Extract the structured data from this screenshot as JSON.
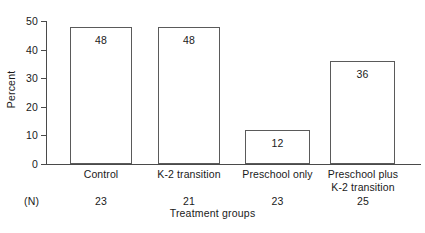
{
  "chart_data": {
    "type": "bar",
    "title": "",
    "xlabel": "Treatment groups",
    "ylabel": "Percent",
    "categories": [
      "Control",
      "K-2 transition",
      "Preschool only",
      "Preschool plus K-2 transition"
    ],
    "category_lines": [
      [
        "Control"
      ],
      [
        "K-2 transition"
      ],
      [
        "Preschool only"
      ],
      [
        "Preschool plus",
        "K-2 transition"
      ]
    ],
    "values": [
      48,
      48,
      12,
      36
    ],
    "value_labels": [
      "48",
      "48",
      "12",
      "36"
    ],
    "n_label": "(N)",
    "n_values": [
      "23",
      "21",
      "23",
      "25"
    ],
    "ylim": [
      0,
      50
    ],
    "yticks": [
      0,
      10,
      20,
      30,
      40,
      50
    ],
    "ytick_labels": [
      "0",
      "10",
      "20",
      "30",
      "40",
      "50"
    ],
    "grid": false,
    "legend": "none",
    "bar_fill_color": "#ffffff",
    "bar_edge_color": "#5a5a5a",
    "axis_color": "#4a4a4a",
    "text_color": "#1a1a1a",
    "background_color": "#ffffff"
  }
}
